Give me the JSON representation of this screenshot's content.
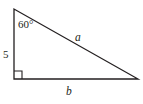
{
  "figure": {
    "type": "right-triangle-diagram",
    "background_color": "#ffffff",
    "stroke_color": "#231f20",
    "stroke_width": 1.3,
    "vertices": {
      "top": [
        14,
        9
      ],
      "bottom_left": [
        14,
        79
      ],
      "bottom_right": [
        138,
        79
      ]
    },
    "right_angle_marker": {
      "at": "bottom_left",
      "size": 8
    },
    "labels": {
      "angle_top": "60°",
      "leg_vertical": "5",
      "hypotenuse": "a",
      "leg_horizontal": "b"
    }
  }
}
